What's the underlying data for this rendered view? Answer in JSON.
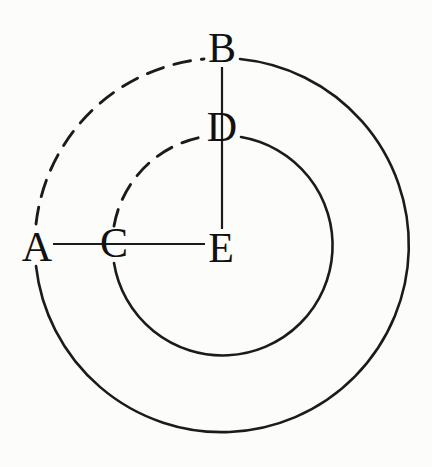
{
  "diagram": {
    "type": "concentric-circles",
    "background_color": "#fcfcfb",
    "stroke_color": "#1b1b1b",
    "points": [
      {
        "id": "A",
        "label": "A",
        "x": 37,
        "y": 247,
        "role": "left point of outer circle"
      },
      {
        "id": "B",
        "label": "B",
        "x": 222,
        "y": 48,
        "role": "top point of outer circle"
      },
      {
        "id": "C",
        "label": "C",
        "x": 114,
        "y": 243,
        "role": "left point of inner circle"
      },
      {
        "id": "D",
        "label": "D",
        "x": 222,
        "y": 127,
        "role": "top point of inner circle"
      },
      {
        "id": "E",
        "label": "E",
        "x": 221,
        "y": 248,
        "role": "common center"
      }
    ],
    "circles": [
      {
        "name": "outer",
        "cx": 222,
        "cy": 245,
        "radius": 187,
        "dashed_part": "upper-left quadrant (from A up to B)"
      },
      {
        "name": "inner",
        "cx": 222,
        "cy": 245,
        "radius": 110,
        "dashed_part": "upper-left quadrant (from C up to D)"
      }
    ],
    "segments": [
      {
        "from": "A",
        "via": "C",
        "to": "E",
        "orientation": "horizontal"
      },
      {
        "from": "B",
        "via": "D",
        "to": "E",
        "orientation": "vertical"
      }
    ]
  }
}
